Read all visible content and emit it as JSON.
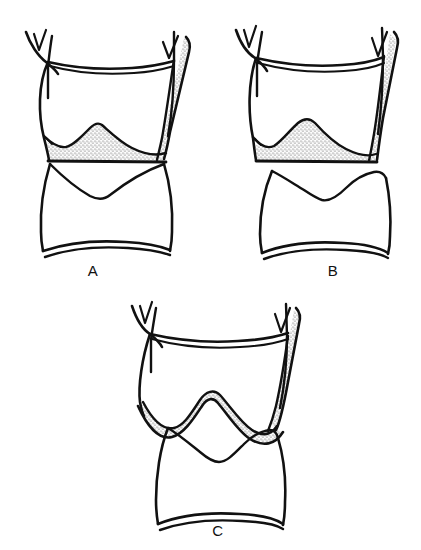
{
  "plate": {
    "title": "Comparative line drawings of three terminalia",
    "background_color": "#ffffff",
    "ink_color": "#111111",
    "stipple_color": "#555555",
    "width": 421,
    "height": 550,
    "figure_count": 3
  },
  "figures": [
    {
      "id": "A",
      "label": "A",
      "label_x": 78,
      "label_y": 262,
      "origin_x": 8,
      "origin_y": 10,
      "stipple_region": "broad peaked mound filling ventral trough",
      "hook_count": 2,
      "lower_segment": "single rounded segment with shallow notch at apex"
    },
    {
      "id": "B",
      "label": "B",
      "label_x": 318,
      "label_y": 262,
      "origin_x": 222,
      "origin_y": 10,
      "stipple_region": "rounded mound centered in ventral trough",
      "hook_count": 2,
      "lower_segment": "segment with double peak and deep central notch"
    },
    {
      "id": "C",
      "label": "C",
      "label_x": 203,
      "label_y": 522,
      "origin_x": 118,
      "origin_y": 296,
      "stipple_region": "narrow band following wavy ventral margin",
      "hook_count": 2,
      "lower_segment": "segment with sharp central peak and lateral shoulder"
    }
  ]
}
